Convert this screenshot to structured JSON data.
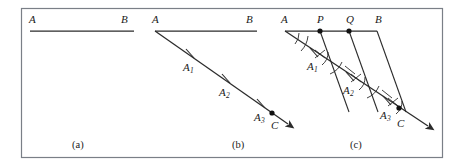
{
  "figure": {
    "background_color": "#ffffff",
    "border_color": "#7a7f87",
    "ink_color": "#2b2b2b",
    "label_color": "#1a1a1a",
    "frame": {
      "x": 21,
      "y": 8,
      "width": 422,
      "height": 150
    }
  },
  "captions": [
    {
      "text": "(a)",
      "x": 72,
      "y": 140
    },
    {
      "text": "(b)",
      "x": 232,
      "y": 140
    },
    {
      "text": "(c)",
      "x": 350,
      "y": 140
    }
  ],
  "panels": [
    {
      "id": "a",
      "caption": "(a)",
      "description": "Given segment AB",
      "segment_AB": {
        "x1": 30,
        "y1": 31,
        "x2": 134,
        "y2": 31
      },
      "labels": [
        {
          "name": "point-label-A",
          "text": "A",
          "sub": "",
          "x": 29,
          "y": 14
        },
        {
          "name": "point-label-B",
          "text": "B",
          "sub": "",
          "x": 121,
          "y": 14
        }
      ]
    },
    {
      "id": "b",
      "caption": "(b)",
      "description": "Ray AC drawn from A with three congruent steps marked A1, A2, A3",
      "segment_AB": {
        "x1": 155,
        "y1": 31,
        "x2": 257,
        "y2": 31
      },
      "ray_AC": {
        "x1": 155,
        "y1": 31,
        "x2": 292,
        "y2": 127
      },
      "ticks": [
        {
          "name": "tick-A1",
          "x": 190,
          "y": 55
        },
        {
          "name": "tick-A2",
          "x": 226,
          "y": 80
        },
        {
          "name": "tick-A3",
          "x": 261,
          "y": 105
        }
      ],
      "point_C": {
        "x": 272,
        "y": 113
      },
      "labels": [
        {
          "name": "point-label-A",
          "text": "A",
          "sub": "",
          "x": 152,
          "y": 14
        },
        {
          "name": "point-label-B",
          "text": "B",
          "sub": "",
          "x": 246,
          "y": 14
        },
        {
          "name": "point-label-A1",
          "text": "A",
          "sub": "1",
          "x": 183,
          "y": 62
        },
        {
          "name": "point-label-A2",
          "text": "A",
          "sub": "2",
          "x": 219,
          "y": 87
        },
        {
          "name": "point-label-A3",
          "text": "A",
          "sub": "3",
          "x": 254,
          "y": 112
        },
        {
          "name": "point-label-C",
          "text": "C",
          "sub": "",
          "x": 271,
          "y": 120
        }
      ]
    },
    {
      "id": "c",
      "caption": "(c)",
      "description": "Parallels through A1 and A2 cut AB at P and Q, trisecting AB",
      "segment_AB": {
        "x1": 285,
        "y1": 31,
        "x2": 377,
        "y2": 31
      },
      "ray_AC": {
        "x1": 285,
        "y1": 31,
        "x2": 432,
        "y2": 129
      },
      "transversals": [
        {
          "name": "parallel-A3-B",
          "x1": 377,
          "y1": 31,
          "x2": 406,
          "y2": 112
        },
        {
          "name": "parallel-A2-Q",
          "x1": 349,
          "y1": 31,
          "x2": 378,
          "y2": 112
        },
        {
          "name": "parallel-A1-P",
          "x1": 320,
          "y1": 31,
          "x2": 349,
          "y2": 112
        }
      ],
      "ticks": [
        {
          "name": "tick-A1",
          "x": 314,
          "y": 53
        },
        {
          "name": "tick-A2",
          "x": 350,
          "y": 77
        },
        {
          "name": "tick-A3",
          "x": 387,
          "y": 101
        }
      ],
      "points": [
        {
          "name": "point-P",
          "x": 320,
          "y": 31
        },
        {
          "name": "point-Q",
          "x": 349,
          "y": 31
        },
        {
          "name": "point-C",
          "x": 399,
          "y": 108
        }
      ],
      "labels": [
        {
          "name": "point-label-A",
          "text": "A",
          "sub": "",
          "x": 281,
          "y": 14
        },
        {
          "name": "point-label-P",
          "text": "P",
          "sub": "",
          "x": 317,
          "y": 14
        },
        {
          "name": "point-label-Q",
          "text": "Q",
          "sub": "",
          "x": 346,
          "y": 14
        },
        {
          "name": "point-label-B",
          "text": "B",
          "sub": "",
          "x": 375,
          "y": 14
        },
        {
          "name": "point-label-A1",
          "text": "A",
          "sub": "1",
          "x": 307,
          "y": 61
        },
        {
          "name": "point-label-A2",
          "text": "A",
          "sub": "2",
          "x": 343,
          "y": 85
        },
        {
          "name": "point-label-A3",
          "text": "A",
          "sub": "3",
          "x": 380,
          "y": 110
        },
        {
          "name": "point-label-C",
          "text": "C",
          "sub": "",
          "x": 397,
          "y": 118
        }
      ]
    }
  ]
}
